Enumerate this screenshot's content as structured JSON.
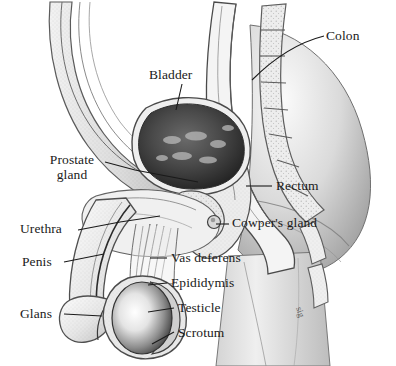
{
  "figure": {
    "background_color": "#ffffff",
    "ink_color": "#1a1a1a",
    "style": "grayscale pen-and-ink medical illustration with stipple shading",
    "signature": "sig"
  },
  "labels": [
    {
      "id": "colon",
      "text": "Colon",
      "x": 326,
      "y": 29,
      "align": "left"
    },
    {
      "id": "bladder",
      "text": "Bladder",
      "x": 149,
      "y": 68,
      "align": "left"
    },
    {
      "id": "prostate_gland",
      "text": "Prostate\ngland",
      "x": 38,
      "y": 152,
      "align": "left"
    },
    {
      "id": "rectum",
      "text": "Rectum",
      "x": 276,
      "y": 179,
      "align": "left"
    },
    {
      "id": "urethra",
      "text": "Urethra",
      "x": 20,
      "y": 222,
      "align": "left"
    },
    {
      "id": "cowpers_gland",
      "text": "Cowper's gland",
      "x": 232,
      "y": 216,
      "align": "left"
    },
    {
      "id": "penis",
      "text": "Penis",
      "x": 22,
      "y": 255,
      "align": "left"
    },
    {
      "id": "vas_deferens",
      "text": "Vas deferens",
      "x": 171,
      "y": 251,
      "align": "left"
    },
    {
      "id": "epididymis",
      "text": "Epididymis",
      "x": 171,
      "y": 276,
      "align": "left"
    },
    {
      "id": "testicle",
      "text": "Testicle",
      "x": 178,
      "y": 301,
      "align": "left"
    },
    {
      "id": "glans",
      "text": "Glans",
      "x": 20,
      "y": 307,
      "align": "left"
    },
    {
      "id": "scrotum",
      "text": "Scrotum",
      "x": 178,
      "y": 326,
      "align": "left"
    }
  ],
  "structures": [
    {
      "id": "abdominal-wall",
      "name": "Abdominal wall"
    },
    {
      "id": "bladder",
      "name": "Bladder"
    },
    {
      "id": "colon",
      "name": "Colon"
    },
    {
      "id": "rectum",
      "name": "Rectum"
    },
    {
      "id": "spine",
      "name": "Sacrum / vertebrae"
    },
    {
      "id": "prostate",
      "name": "Prostate gland"
    },
    {
      "id": "cowpers-gland",
      "name": "Cowper's gland"
    },
    {
      "id": "urethra",
      "name": "Urethra"
    },
    {
      "id": "penis",
      "name": "Penis"
    },
    {
      "id": "glans",
      "name": "Glans"
    },
    {
      "id": "vas-deferens",
      "name": "Vas deferens"
    },
    {
      "id": "epididymis",
      "name": "Epididymis"
    },
    {
      "id": "testicle",
      "name": "Testicle"
    },
    {
      "id": "scrotum",
      "name": "Scrotum"
    },
    {
      "id": "buttock",
      "name": "Buttock / thigh"
    }
  ]
}
